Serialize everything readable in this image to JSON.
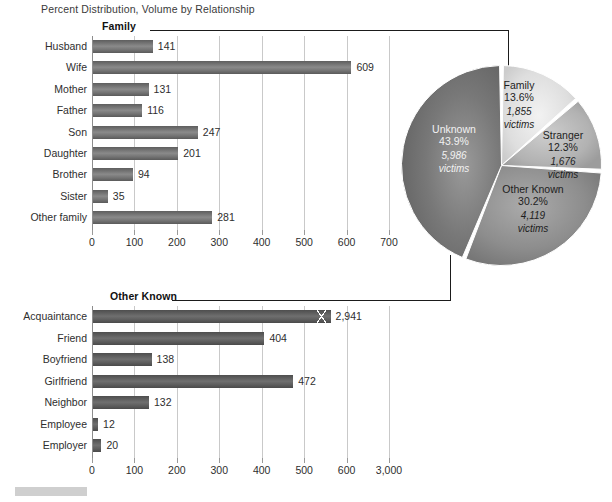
{
  "title": "Percent Distribution, Volume by Relationship",
  "panels": {
    "family_label": "Family",
    "other_known_label": "Other Known"
  },
  "footer": {
    "swatch_label": ""
  },
  "chart_data": [
    {
      "type": "bar",
      "orientation": "horizontal",
      "title": "Family",
      "xlabel": "",
      "ylabel": "",
      "xlim": [
        0,
        700
      ],
      "grid": true,
      "categories": [
        "Husband",
        "Wife",
        "Mother",
        "Father",
        "Son",
        "Daughter",
        "Brother",
        "Sister",
        "Other family"
      ],
      "values": [
        141,
        609,
        131,
        116,
        247,
        201,
        94,
        35,
        281
      ],
      "value_labels": [
        "141",
        "609",
        "131",
        "116",
        "247",
        "201",
        "94",
        "35",
        "281"
      ],
      "ticks": [
        0,
        100,
        200,
        300,
        400,
        500,
        600,
        700
      ],
      "tick_labels": [
        "0",
        "100",
        "200",
        "300",
        "400",
        "500",
        "600",
        "700"
      ]
    },
    {
      "type": "bar",
      "orientation": "horizontal",
      "title": "Other Known",
      "xlabel": "",
      "ylabel": "",
      "xlim": [
        0,
        700
      ],
      "grid": true,
      "axis_break": true,
      "axis_break_note": "final tick is 3,000; Acquaintance bar is broken",
      "categories": [
        "Acquaintance",
        "Friend",
        "Boyfriend",
        "Girlfriend",
        "Neighbor",
        "Employee",
        "Employer"
      ],
      "values": [
        2941,
        404,
        138,
        472,
        132,
        12,
        20
      ],
      "value_labels": [
        "2,941",
        "404",
        "138",
        "472",
        "132",
        "12",
        "20"
      ],
      "ticks": [
        0,
        100,
        200,
        300,
        400,
        500,
        600,
        700
      ],
      "tick_labels": [
        "0",
        "100",
        "200",
        "300",
        "400",
        "500",
        "600",
        "3,000"
      ]
    },
    {
      "type": "pie",
      "title": "",
      "legend_position": "inside",
      "categories": [
        "Family",
        "Stranger",
        "Other Known",
        "Unknown"
      ],
      "values": [
        13.6,
        12.3,
        30.2,
        43.9
      ],
      "victims": [
        1855,
        1676,
        4119,
        5986
      ],
      "slices": [
        {
          "name": "Family",
          "pct_label": "13.6%",
          "victims_label": "1,855",
          "victims_unit": "victims",
          "color": "#dcdcdc"
        },
        {
          "name": "Stranger",
          "pct_label": "12.3%",
          "victims_label": "1,676",
          "victims_unit": "victims",
          "color": "#b4b4b4"
        },
        {
          "name": "Other Known",
          "pct_label": "30.2%",
          "victims_label": "4,119",
          "victims_unit": "victims",
          "color": "#8f8f8f"
        },
        {
          "name": "Unknown",
          "pct_label": "43.9%",
          "victims_label": "5,986",
          "victims_unit": "victims",
          "color": "#6f6f6f"
        }
      ]
    }
  ]
}
